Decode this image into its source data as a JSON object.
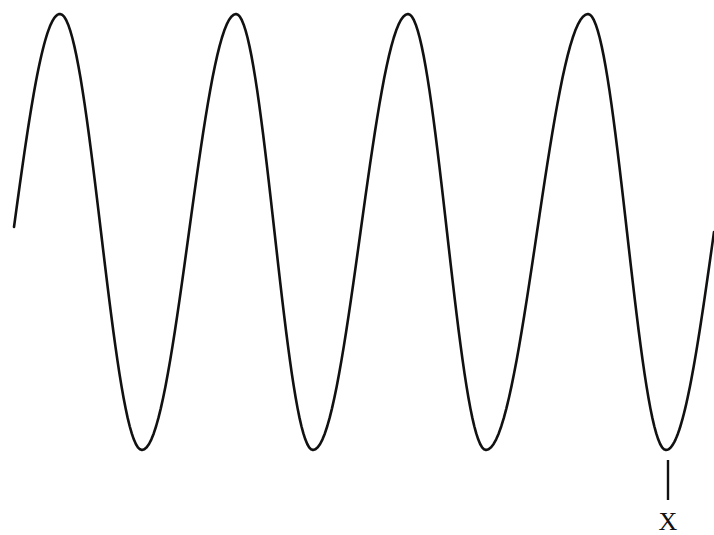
{
  "diagram": {
    "type": "sine-wave",
    "colors": {
      "background": "#ffffff",
      "stroke": "#111111"
    },
    "wave": {
      "start": {
        "x": 14,
        "y": 227
      },
      "end": {
        "x": 714,
        "y": 232
      },
      "crests_x": [
        60,
        236,
        408,
        588
      ],
      "troughs_x": [
        142,
        313,
        486,
        666
      ],
      "crest_y": 14,
      "trough_y": 450,
      "cycles_visible": 4
    },
    "marker": {
      "label": "X",
      "x": 668,
      "line_top_y": 460,
      "line_bottom_y": 500,
      "label_y": 530,
      "points_to": "trough"
    }
  }
}
